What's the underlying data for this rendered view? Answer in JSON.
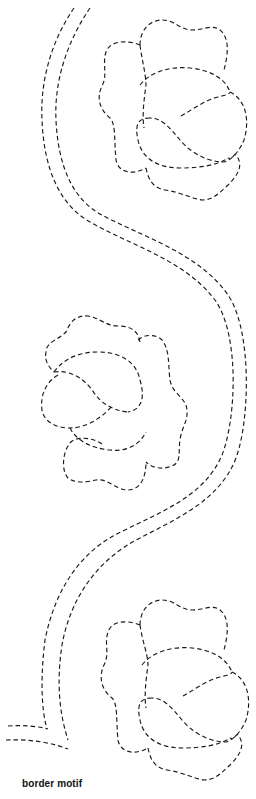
{
  "caption": "border motif",
  "colors": {
    "line": "#1a1a1a",
    "background": "#ffffff"
  },
  "diagram": {
    "type": "quilting stencil",
    "line_style": "dashed",
    "elements": [
      {
        "name": "double-vine",
        "description": "S-shaped double dashed vine running from top-left, sweeping right, back left, ending in a mitered corner at bottom-left"
      },
      {
        "name": "flower-top",
        "position": "upper right",
        "orientation": "facing right"
      },
      {
        "name": "flower-middle",
        "position": "middle left",
        "orientation": "facing left"
      },
      {
        "name": "flower-bottom",
        "position": "lower right",
        "orientation": "facing right"
      }
    ]
  }
}
